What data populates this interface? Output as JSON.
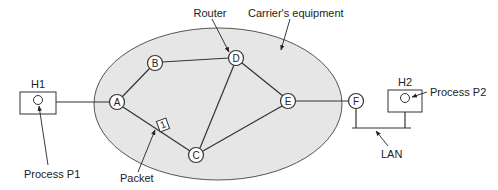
{
  "diagram": {
    "type": "network-topology",
    "carrier_region": {
      "label": "Carrier's equipment",
      "fill": "#e6e6e6",
      "stroke": "#555555"
    },
    "labels": {
      "router": "Router",
      "carrier": "Carrier's equipment",
      "h1": "H1",
      "h2": "H2",
      "process_p1": "Process P1",
      "process_p2": "Process P2",
      "packet": "Packet",
      "packet_number": "1",
      "lan": "LAN"
    },
    "routers": [
      {
        "id": "A",
        "label": "A"
      },
      {
        "id": "B",
        "label": "B"
      },
      {
        "id": "C",
        "label": "C"
      },
      {
        "id": "D",
        "label": "D"
      },
      {
        "id": "E",
        "label": "E"
      },
      {
        "id": "F",
        "label": "F"
      }
    ],
    "links": [
      [
        "H1",
        "A"
      ],
      [
        "A",
        "B"
      ],
      [
        "B",
        "D"
      ],
      [
        "A",
        "C"
      ],
      [
        "C",
        "D"
      ],
      [
        "C",
        "E"
      ],
      [
        "D",
        "E"
      ],
      [
        "E",
        "F"
      ],
      [
        "F",
        "LAN"
      ],
      [
        "H2",
        "LAN"
      ]
    ],
    "hosts": [
      {
        "id": "H1",
        "label": "H1",
        "process": "Process P1"
      },
      {
        "id": "H2",
        "label": "H2",
        "process": "Process P2"
      }
    ]
  }
}
